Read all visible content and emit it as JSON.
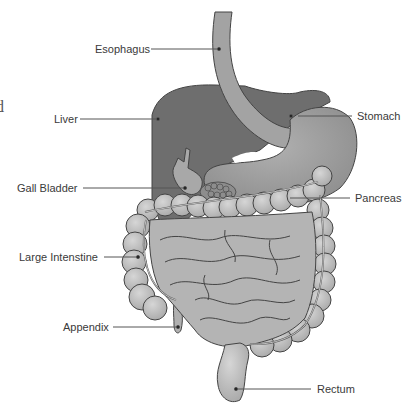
{
  "diagram": {
    "clipped_left_text": "d",
    "labels": [
      {
        "id": "esophagus",
        "text": "Esophagus",
        "x": 95,
        "y": 43,
        "side": "left"
      },
      {
        "id": "liver",
        "text": "Liver",
        "x": 54,
        "y": 113,
        "side": "left"
      },
      {
        "id": "stomach",
        "text": "Stomach",
        "x": 357,
        "y": 110,
        "side": "right"
      },
      {
        "id": "gall-bladder",
        "text": "Gall Bladder",
        "x": 17,
        "y": 182,
        "side": "left"
      },
      {
        "id": "pancreas",
        "text": "Pancreas",
        "x": 355,
        "y": 192,
        "side": "right"
      },
      {
        "id": "large-intestine",
        "text": "Large Intenstine",
        "x": 19,
        "y": 251,
        "side": "left"
      },
      {
        "id": "appendix",
        "text": "Appendix",
        "x": 63,
        "y": 321,
        "side": "left"
      },
      {
        "id": "rectum",
        "text": "Rectum",
        "x": 317,
        "y": 383,
        "side": "right"
      }
    ],
    "colors": {
      "liver": "#6b6b6b",
      "stomach": "#9a9a9a",
      "esophagus": "#a2a2a2",
      "intestine": "#b8b8b8",
      "outline": "#3c3c3c",
      "leader": "#555555",
      "text": "#3a3a3a"
    }
  }
}
